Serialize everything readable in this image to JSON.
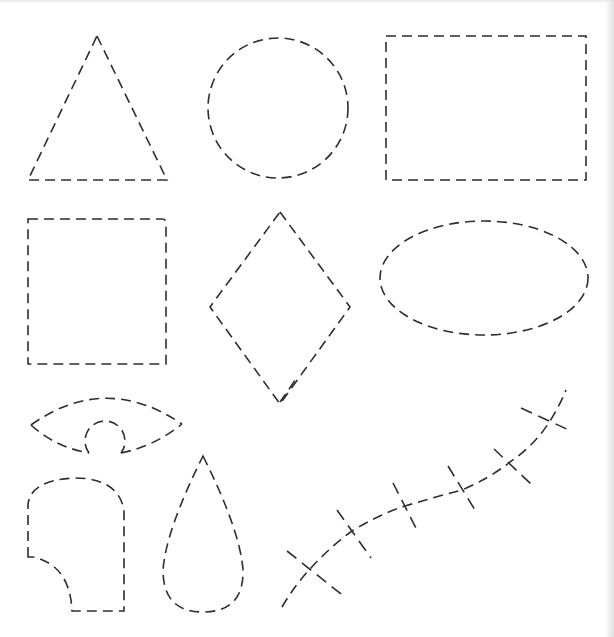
{
  "page": {
    "title": "Dashed cut-out shapes worksheet",
    "background": "#ffffff",
    "stroke_color": "#2e2e2e"
  },
  "shapes": [
    {
      "id": "triangle",
      "label": "Triangle"
    },
    {
      "id": "circle",
      "label": "Circle"
    },
    {
      "id": "rectangle",
      "label": "Rectangle"
    },
    {
      "id": "square",
      "label": "Square"
    },
    {
      "id": "diamond",
      "label": "Diamond"
    },
    {
      "id": "oval",
      "label": "Oval"
    },
    {
      "id": "eye",
      "label": "Eye"
    },
    {
      "id": "rounded-notch",
      "label": "Rounded shape with notch"
    },
    {
      "id": "teardrop",
      "label": "Teardrop"
    },
    {
      "id": "stitched-curve",
      "label": "Stitched curve",
      "stitch_count": 6
    }
  ]
}
